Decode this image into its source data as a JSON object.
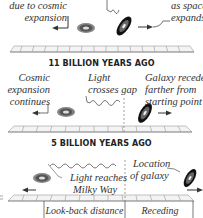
{
  "panels": [
    {
      "label": "11 BILLION YEARS AGO",
      "left_caption": [
        "due to cosmic",
        "expansion"
      ],
      "right_caption": [
        "as space",
        "expands"
      ]
    },
    {
      "label": "5 BILLION YEARS AGO",
      "left_caption": [
        "Cosmic",
        "expansion",
        "continues"
      ],
      "center_caption": [
        "Light",
        "crosses gap"
      ],
      "right_caption": [
        "Galaxy recedes",
        "farther from",
        "starting point"
      ]
    },
    {
      "left_caption": [
        "Light reaches",
        "Milky Way"
      ],
      "right_caption": [
        "Location",
        "of galaxy"
      ],
      "distance_labels": {
        "look_back": "Look-back distance",
        "receding": "Receding distance"
      }
    }
  ],
  "colors": {
    "ink": "#222222",
    "grid": "#9a9a9a",
    "galaxy_dark": "#1a1a1a",
    "galaxy_mid": "#666666"
  }
}
